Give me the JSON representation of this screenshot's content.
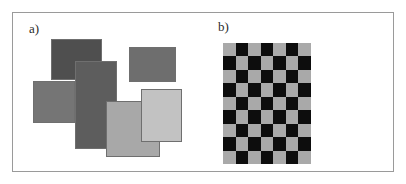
{
  "figure": {
    "background_color": "#ffffff",
    "frame_color": "#9a9a9a",
    "width": 406,
    "height": 184
  },
  "panel_a": {
    "label": "a)",
    "description": "overlapping-gray-rectangles",
    "rectangles": [
      {
        "name": "rect-dark-top-left",
        "x": 38,
        "y": 26,
        "w": 51,
        "h": 41,
        "fill": "#4f4f4f",
        "stroke": "#6f6f6f"
      },
      {
        "name": "rect-medium-upper-right",
        "x": 116,
        "y": 34,
        "w": 47,
        "h": 35,
        "fill": "#6e6e6e",
        "stroke": "#6f6f6f"
      },
      {
        "name": "rect-gray-left",
        "x": 20,
        "y": 68,
        "w": 42,
        "h": 42,
        "fill": "#757575",
        "stroke": "#6f6f6f"
      },
      {
        "name": "rect-dark-vertical",
        "x": 62,
        "y": 48,
        "w": 42,
        "h": 88,
        "fill": "#5d5d5d",
        "stroke": "#6f6f6f"
      },
      {
        "name": "rect-light-center",
        "x": 93,
        "y": 88,
        "w": 54,
        "h": 56,
        "fill": "#a8a8a8",
        "stroke": "#6f6f6f"
      },
      {
        "name": "rect-lightest-right",
        "x": 128,
        "y": 76,
        "w": 41,
        "h": 53,
        "fill": "#c2c2c2",
        "stroke": "#6f6f6f"
      }
    ]
  },
  "panel_b": {
    "label": "b)",
    "description": "checkerboard-pattern",
    "checkerboard": {
      "x": 19,
      "y": 30,
      "width": 88,
      "height": 121,
      "columns": 7,
      "rows": 9,
      "dark_color": "#0d0d0d",
      "light_color": "#a9a9a9",
      "start_with_light": true
    }
  }
}
